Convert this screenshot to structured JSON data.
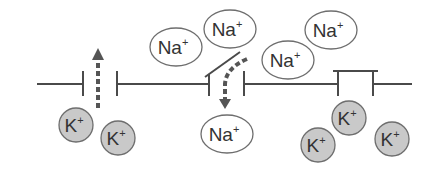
{
  "diagram": {
    "membrane": {
      "y": 84,
      "x_start": 37,
      "x_end": 412,
      "color": "#4a4a4a"
    },
    "channels": [
      {
        "name": "potassium-leak-channel",
        "state": "open",
        "left_wall_x": 83,
        "right_wall_x": 117,
        "flow": "up"
      },
      {
        "name": "sodium-gated-channel",
        "state": "open-lid",
        "left_wall_x": 209,
        "right_wall_x": 244,
        "flow": "down"
      },
      {
        "name": "closed-channel",
        "state": "closed",
        "left_wall_x": 338,
        "right_wall_x": 373,
        "flow": "none"
      }
    ],
    "na_ions": [
      {
        "label": "Na",
        "charge": "+",
        "cx": 176,
        "cy": 47
      },
      {
        "label": "Na",
        "charge": "+",
        "cx": 230,
        "cy": 29
      },
      {
        "label": "Na",
        "charge": "+",
        "cx": 288,
        "cy": 60
      },
      {
        "label": "Na",
        "charge": "+",
        "cx": 331,
        "cy": 30
      },
      {
        "label": "Na",
        "charge": "+",
        "cx": 227,
        "cy": 134
      }
    ],
    "k_ions": [
      {
        "label": "K",
        "charge": "+",
        "cx": 76,
        "cy": 125
      },
      {
        "label": "K",
        "charge": "+",
        "cx": 118,
        "cy": 138
      },
      {
        "label": "K",
        "charge": "+",
        "cx": 349,
        "cy": 118
      },
      {
        "label": "K",
        "charge": "+",
        "cx": 318,
        "cy": 145
      },
      {
        "label": "K",
        "charge": "+",
        "cx": 392,
        "cy": 139
      }
    ],
    "colors": {
      "line": "#4a4a4a",
      "arrow": "#555555",
      "na_fill": "#ffffff",
      "na_stroke": "#6e6e6e",
      "k_fill": "#c9c9c9",
      "k_stroke": "#6e6e6e",
      "text": "#333333"
    }
  }
}
